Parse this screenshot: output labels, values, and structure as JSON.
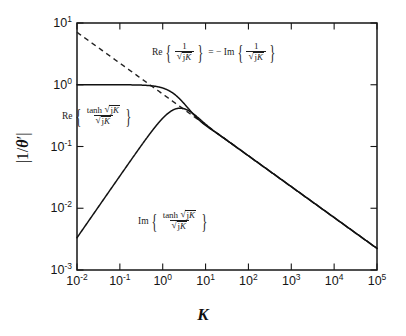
{
  "chart_data": {
    "type": "line",
    "title": "",
    "xlabel": "K",
    "ylabel": "|1/θ'|",
    "xscale": "log",
    "yscale": "log",
    "xlim": [
      0.01,
      100000
    ],
    "ylim": [
      0.001,
      10
    ],
    "grid": false,
    "legend_position": "inline-annotations",
    "xticks": [
      {
        "value": 0.01,
        "label": "10",
        "exp": "-2"
      },
      {
        "value": 0.1,
        "label": "10",
        "exp": "-1"
      },
      {
        "value": 1,
        "label": "10",
        "exp": "0"
      },
      {
        "value": 10,
        "label": "10",
        "exp": "1"
      },
      {
        "value": 100,
        "label": "10",
        "exp": "2"
      },
      {
        "value": 1000,
        "label": "10",
        "exp": "3"
      },
      {
        "value": 10000,
        "label": "10",
        "exp": "4"
      },
      {
        "value": 100000,
        "label": "10",
        "exp": "5"
      }
    ],
    "yticks": [
      {
        "value": 10,
        "label": "10",
        "exp": "1"
      },
      {
        "value": 1,
        "label": "10",
        "exp": "0"
      },
      {
        "value": 0.1,
        "label": "10",
        "exp": "-1"
      },
      {
        "value": 0.01,
        "label": "10",
        "exp": "-2"
      },
      {
        "value": 0.001,
        "label": "10",
        "exp": "-3"
      }
    ],
    "series": [
      {
        "name": "Re{tanh sqrt(jK)/sqrt(jK)}",
        "style": "solid",
        "x": [
          0.01,
          0.02,
          0.05,
          0.1,
          0.2,
          0.3,
          0.5,
          0.7,
          1.0,
          1.5,
          2.0,
          3.0,
          4.0,
          5.0,
          7.0,
          10.0,
          15.0,
          20.0,
          30.0,
          50.0,
          100.0,
          300.0,
          1000.0,
          3000.0,
          10000.0,
          30000.0,
          100000.0
        ],
        "y": [
          1.0,
          1.0,
          1.0,
          0.99997,
          0.9995,
          0.9975,
          0.9802,
          0.9634,
          0.9298,
          0.8607,
          0.7903,
          0.6672,
          0.579,
          0.5151,
          0.4302,
          0.3575,
          0.2882,
          0.2479,
          0.2012,
          0.1554,
          0.1096,
          0.0632,
          0.0346,
          0.02,
          0.01095,
          0.00632,
          0.00346
        ]
      },
      {
        "name": "Im{tanh sqrt(jK)/sqrt(jK)}",
        "style": "solid",
        "x": [
          0.01,
          0.02,
          0.05,
          0.1,
          0.2,
          0.3,
          0.5,
          0.7,
          1.0,
          1.5,
          2.0,
          2.5,
          3.0,
          4.0,
          5.0,
          7.0,
          10.0,
          15.0,
          20.0,
          30.0,
          50.0,
          100.0,
          300.0,
          1000.0,
          3000.0,
          10000.0,
          30000.0,
          100000.0
        ],
        "y": [
          0.00333,
          0.00667,
          0.01667,
          0.0333,
          0.0666,
          0.0997,
          0.1648,
          0.2272,
          0.3137,
          0.4081,
          0.4551,
          0.4629,
          0.4511,
          0.413,
          0.3765,
          0.3283,
          0.285,
          0.2437,
          0.2187,
          0.1863,
          0.1494,
          0.1079,
          0.063,
          0.0345,
          0.02,
          0.01094,
          0.00632,
          0.00346
        ]
      },
      {
        "name": "Re{1/sqrt(jK)} = -Im{1/sqrt(jK)}",
        "style": "dashed",
        "x": [
          0.01,
          0.1,
          1.0,
          10.0,
          50.0
        ],
        "y": [
          7.071,
          2.236,
          0.7071,
          0.2236,
          0.1
        ]
      }
    ],
    "annotations": [
      {
        "id": "asymptote-label",
        "text": "Re{1/√(jK)} = −Im{1/√(jK)}",
        "fn1": "Re",
        "fn2": "Im",
        "numerator": "1",
        "denominator": "√jK",
        "relation": "= −",
        "x": 0.55,
        "y": 3.2
      },
      {
        "id": "real-part-label",
        "text": "Re{tanh√(jK)/√(jK)}",
        "fn": "Re",
        "numerator": "tanh √jK",
        "denominator": "√jK",
        "x": 0.045,
        "y": 0.45
      },
      {
        "id": "imag-part-label",
        "text": "Im{tanh√(jK)/√(jK)}",
        "fn": "Im",
        "numerator": "tanh √jK",
        "denominator": "√jK",
        "x": 3.0,
        "y": 0.016
      }
    ],
    "colors": {
      "curve": "#111111",
      "asymptote": "#222222",
      "axis": "#161616",
      "background": "#ffffff"
    }
  },
  "labels": {
    "x_axis": "K",
    "y_axis_prefix": "|1/",
    "y_axis_symbol": "θ",
    "y_axis_suffix": "'|",
    "tanh": "tanh",
    "re": "Re",
    "im": "Im",
    "one": "1",
    "jK": "jK",
    "equals_minus": "= −"
  }
}
